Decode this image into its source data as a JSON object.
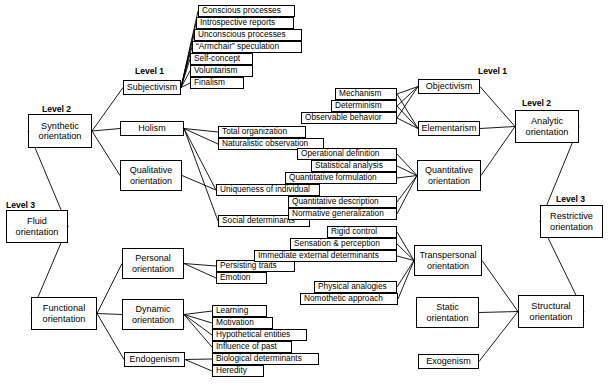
{
  "diagram": {
    "line_color": "#000000",
    "box_fill": "#ffffff",
    "box_border": "#000000",
    "level_labels": [
      {
        "id": "lvl-left-1",
        "text": "Level 1",
        "x": 135,
        "y": 66
      },
      {
        "id": "lvl-left-2",
        "text": "Level 2",
        "x": 42,
        "y": 104
      },
      {
        "id": "lvl-left-3",
        "text": "Level 3",
        "x": 6,
        "y": 200
      },
      {
        "id": "lvl-right-1",
        "text": "Level 1",
        "x": 478,
        "y": 66
      },
      {
        "id": "lvl-right-2",
        "text": "Level 2",
        "x": 522,
        "y": 98
      },
      {
        "id": "lvl-right-3",
        "text": "Level 3",
        "x": 556,
        "y": 194
      }
    ],
    "nodes": [
      {
        "id": "synthetic-orientation",
        "label": "Synthetic\norientation",
        "kind": "major",
        "x": 28,
        "y": 114,
        "w": 64,
        "h": 34
      },
      {
        "id": "fluid-orientation",
        "label": "Fluid\norientation",
        "kind": "major",
        "x": 6,
        "y": 210,
        "w": 62,
        "h": 33
      },
      {
        "id": "functional-orientation",
        "label": "Functional\norientation",
        "kind": "major",
        "x": 31,
        "y": 297,
        "w": 66,
        "h": 33
      },
      {
        "id": "subjectivism",
        "label": "Subjectivism",
        "kind": "mid",
        "x": 123,
        "y": 80,
        "w": 58,
        "h": 15
      },
      {
        "id": "holism",
        "label": "Holism",
        "kind": "mid",
        "x": 120,
        "y": 121,
        "w": 64,
        "h": 15
      },
      {
        "id": "qualitative-orientation",
        "label": "Qualitative\norientation",
        "kind": "mid",
        "x": 120,
        "y": 160,
        "w": 62,
        "h": 31
      },
      {
        "id": "personal-orientation",
        "label": "Personal\norientation",
        "kind": "mid",
        "x": 122,
        "y": 248,
        "w": 62,
        "h": 31
      },
      {
        "id": "dynamic-orientation",
        "label": "Dynamic\norientation",
        "kind": "mid",
        "x": 122,
        "y": 299,
        "w": 62,
        "h": 31
      },
      {
        "id": "endogenism",
        "label": "Endogenism",
        "kind": "mid",
        "x": 124,
        "y": 352,
        "w": 61,
        "h": 15
      },
      {
        "id": "objectivism",
        "label": "Objectivism",
        "kind": "mid",
        "x": 418,
        "y": 79,
        "w": 62,
        "h": 15
      },
      {
        "id": "elementarism",
        "label": "Elementarism",
        "kind": "mid",
        "x": 418,
        "y": 121,
        "w": 62,
        "h": 15
      },
      {
        "id": "quantitative-orientation",
        "label": "Quantitative\norientation",
        "kind": "mid",
        "x": 417,
        "y": 160,
        "w": 64,
        "h": 31
      },
      {
        "id": "transpersonal-orientation",
        "label": "Transpersonal\norientation",
        "kind": "mid",
        "x": 414,
        "y": 245,
        "w": 68,
        "h": 31
      },
      {
        "id": "static-orientation",
        "label": "Static\norientation",
        "kind": "mid",
        "x": 416,
        "y": 297,
        "w": 63,
        "h": 31
      },
      {
        "id": "exogenism",
        "label": "Exogenism",
        "kind": "mid",
        "x": 418,
        "y": 354,
        "w": 61,
        "h": 15
      },
      {
        "id": "analytic-orientation",
        "label": "Analytic\norientation",
        "kind": "major",
        "x": 515,
        "y": 110,
        "w": 64,
        "h": 33
      },
      {
        "id": "restrictive-orientation",
        "label": "Restrictive\norientation",
        "kind": "major",
        "x": 540,
        "y": 205,
        "w": 63,
        "h": 33
      },
      {
        "id": "structural-orientation",
        "label": "Structural\norientation",
        "kind": "major",
        "x": 518,
        "y": 295,
        "w": 66,
        "h": 33
      },
      {
        "id": "conscious-processes",
        "label": "Conscious processes",
        "kind": "leaf",
        "x": 198,
        "y": 5,
        "w": 97,
        "h": 12
      },
      {
        "id": "introspective-reports",
        "label": "Introspective reports",
        "kind": "leaf",
        "x": 196,
        "y": 17,
        "w": 98,
        "h": 12
      },
      {
        "id": "unconscious-processes",
        "label": "Unconscious processes",
        "kind": "leaf",
        "x": 194,
        "y": 29,
        "w": 108,
        "h": 12
      },
      {
        "id": "armchair-speculation",
        "label": "“Armchair” speculation",
        "kind": "leaf",
        "x": 192,
        "y": 41,
        "w": 110,
        "h": 12
      },
      {
        "id": "self-concept",
        "label": "Self-concept",
        "kind": "leaf",
        "x": 190,
        "y": 53,
        "w": 63,
        "h": 12
      },
      {
        "id": "voluntarism",
        "label": "Voluntarism",
        "kind": "leaf",
        "x": 190,
        "y": 65,
        "w": 63,
        "h": 12
      },
      {
        "id": "finalism",
        "label": "Finalism",
        "kind": "leaf",
        "x": 190,
        "y": 77,
        "w": 54,
        "h": 12
      },
      {
        "id": "total-organization",
        "label": "Total organization",
        "kind": "leaf",
        "x": 218,
        "y": 126,
        "w": 88,
        "h": 12
      },
      {
        "id": "naturalistic-observation",
        "label": "Naturalistic observation",
        "kind": "leaf",
        "x": 218,
        "y": 138,
        "w": 106,
        "h": 12
      },
      {
        "id": "uniqueness-of-individual",
        "label": "Uniqueness of individual",
        "kind": "leaf",
        "x": 216,
        "y": 184,
        "w": 104,
        "h": 12
      },
      {
        "id": "social-determinants",
        "label": "Social determinants",
        "kind": "leaf",
        "x": 218,
        "y": 215,
        "w": 92,
        "h": 12
      },
      {
        "id": "persisting-traits",
        "label": "Persisting traits",
        "kind": "leaf",
        "x": 216,
        "y": 260,
        "w": 79,
        "h": 12
      },
      {
        "id": "emotion",
        "label": "Emotion",
        "kind": "leaf",
        "x": 216,
        "y": 272,
        "w": 51,
        "h": 12
      },
      {
        "id": "learning",
        "label": "Learning",
        "kind": "leaf",
        "x": 212,
        "y": 305,
        "w": 55,
        "h": 12
      },
      {
        "id": "motivation",
        "label": "Motivation",
        "kind": "leaf",
        "x": 212,
        "y": 317,
        "w": 61,
        "h": 12
      },
      {
        "id": "hypothetical-entities",
        "label": "Hypothetical entities",
        "kind": "leaf",
        "x": 212,
        "y": 329,
        "w": 95,
        "h": 12
      },
      {
        "id": "influence-of-past",
        "label": "Influence of past",
        "kind": "leaf",
        "x": 212,
        "y": 341,
        "w": 80,
        "h": 12
      },
      {
        "id": "biological-determinants",
        "label": "Biological determinants",
        "kind": "leaf",
        "x": 212,
        "y": 353,
        "w": 107,
        "h": 12
      },
      {
        "id": "heredity",
        "label": "Heredity",
        "kind": "leaf",
        "x": 212,
        "y": 365,
        "w": 52,
        "h": 12
      },
      {
        "id": "mechanism",
        "label": "Mechanism",
        "kind": "leaf",
        "x": 335,
        "y": 88,
        "w": 62,
        "h": 12
      },
      {
        "id": "determinism",
        "label": "Determinism",
        "kind": "leaf",
        "x": 331,
        "y": 100,
        "w": 66,
        "h": 12
      },
      {
        "id": "observable-behavior",
        "label": "Observable behavior",
        "kind": "leaf",
        "x": 301,
        "y": 112,
        "w": 96,
        "h": 12
      },
      {
        "id": "operational-definition",
        "label": "Operational definition",
        "kind": "leaf",
        "x": 297,
        "y": 148,
        "w": 100,
        "h": 12
      },
      {
        "id": "statistical-analysis",
        "label": "Statistical analysis",
        "kind": "leaf",
        "x": 311,
        "y": 160,
        "w": 86,
        "h": 12
      },
      {
        "id": "quantitative-formulation",
        "label": "Quantitative formulation",
        "kind": "leaf",
        "x": 285,
        "y": 172,
        "w": 112,
        "h": 12
      },
      {
        "id": "quantitative-description",
        "label": "Quantitative description",
        "kind": "leaf",
        "x": 288,
        "y": 196,
        "w": 109,
        "h": 12
      },
      {
        "id": "normative-generalization",
        "label": "Normative generalization",
        "kind": "leaf",
        "x": 288,
        "y": 208,
        "w": 109,
        "h": 12
      },
      {
        "id": "rigid-control",
        "label": "Rigid control",
        "kind": "leaf",
        "x": 327,
        "y": 226,
        "w": 70,
        "h": 12
      },
      {
        "id": "sensation-perception",
        "label": "Sensation & perception",
        "kind": "leaf",
        "x": 290,
        "y": 238,
        "w": 107,
        "h": 12
      },
      {
        "id": "immediate-external-determinants",
        "label": "Immediate external determinants",
        "kind": "leaf",
        "x": 254,
        "y": 250,
        "w": 143,
        "h": 12
      },
      {
        "id": "physical-analogies",
        "label": "Physical analogies",
        "kind": "leaf",
        "x": 314,
        "y": 281,
        "w": 83,
        "h": 12
      },
      {
        "id": "nomothetic-approach",
        "label": "Nomothetic approach",
        "kind": "leaf",
        "x": 300,
        "y": 293,
        "w": 98,
        "h": 12
      }
    ],
    "edges": [
      {
        "from": "synthetic-orientation",
        "to": "subjectivism"
      },
      {
        "from": "synthetic-orientation",
        "to": "holism"
      },
      {
        "from": "synthetic-orientation",
        "to": "qualitative-orientation"
      },
      {
        "from": "synthetic-orientation",
        "to": "fluid-orientation"
      },
      {
        "from": "fluid-orientation",
        "to": "functional-orientation"
      },
      {
        "from": "functional-orientation",
        "to": "personal-orientation"
      },
      {
        "from": "functional-orientation",
        "to": "dynamic-orientation"
      },
      {
        "from": "functional-orientation",
        "to": "endogenism"
      },
      {
        "from": "subjectivism",
        "to": "conscious-processes"
      },
      {
        "from": "subjectivism",
        "to": "introspective-reports"
      },
      {
        "from": "subjectivism",
        "to": "unconscious-processes"
      },
      {
        "from": "subjectivism",
        "to": "armchair-speculation"
      },
      {
        "from": "subjectivism",
        "to": "self-concept"
      },
      {
        "from": "subjectivism",
        "to": "voluntarism"
      },
      {
        "from": "subjectivism",
        "to": "finalism"
      },
      {
        "from": "holism",
        "to": "total-organization"
      },
      {
        "from": "holism",
        "to": "naturalistic-observation"
      },
      {
        "from": "holism",
        "to": "uniqueness-of-individual"
      },
      {
        "from": "holism",
        "to": "social-determinants"
      },
      {
        "from": "qualitative-orientation",
        "to": "uniqueness-of-individual"
      },
      {
        "from": "personal-orientation",
        "to": "persisting-traits"
      },
      {
        "from": "personal-orientation",
        "to": "emotion"
      },
      {
        "from": "dynamic-orientation",
        "to": "learning"
      },
      {
        "from": "dynamic-orientation",
        "to": "motivation"
      },
      {
        "from": "dynamic-orientation",
        "to": "hypothetical-entities"
      },
      {
        "from": "dynamic-orientation",
        "to": "influence-of-past"
      },
      {
        "from": "endogenism",
        "to": "biological-determinants"
      },
      {
        "from": "endogenism",
        "to": "heredity"
      },
      {
        "from": "mechanism",
        "to": "objectivism"
      },
      {
        "from": "determinism",
        "to": "objectivism"
      },
      {
        "from": "observable-behavior",
        "to": "objectivism"
      },
      {
        "from": "mechanism",
        "to": "elementarism"
      },
      {
        "from": "determinism",
        "to": "elementarism"
      },
      {
        "from": "observable-behavior",
        "to": "elementarism"
      },
      {
        "from": "operational-definition",
        "to": "quantitative-orientation"
      },
      {
        "from": "statistical-analysis",
        "to": "quantitative-orientation"
      },
      {
        "from": "quantitative-formulation",
        "to": "quantitative-orientation"
      },
      {
        "from": "quantitative-description",
        "to": "quantitative-orientation"
      },
      {
        "from": "normative-generalization",
        "to": "quantitative-orientation"
      },
      {
        "from": "rigid-control",
        "to": "transpersonal-orientation"
      },
      {
        "from": "sensation-perception",
        "to": "transpersonal-orientation"
      },
      {
        "from": "immediate-external-determinants",
        "to": "transpersonal-orientation"
      },
      {
        "from": "physical-analogies",
        "to": "transpersonal-orientation"
      },
      {
        "from": "nomothetic-approach",
        "to": "transpersonal-orientation"
      },
      {
        "from": "objectivism",
        "to": "analytic-orientation"
      },
      {
        "from": "elementarism",
        "to": "analytic-orientation"
      },
      {
        "from": "quantitative-orientation",
        "to": "analytic-orientation"
      },
      {
        "from": "analytic-orientation",
        "to": "restrictive-orientation"
      },
      {
        "from": "restrictive-orientation",
        "to": "structural-orientation"
      },
      {
        "from": "transpersonal-orientation",
        "to": "structural-orientation"
      },
      {
        "from": "static-orientation",
        "to": "structural-orientation"
      },
      {
        "from": "exogenism",
        "to": "structural-orientation"
      }
    ]
  }
}
